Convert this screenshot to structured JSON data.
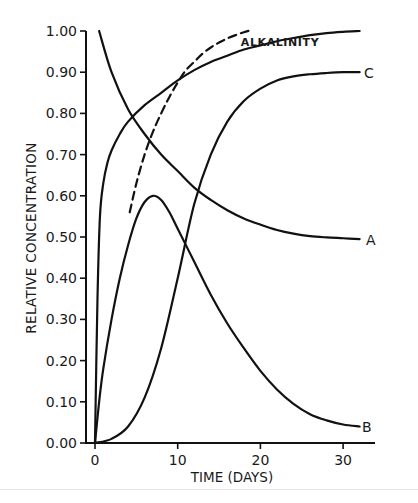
{
  "chart_data": {
    "type": "line",
    "title": "",
    "xlabel": "TIME (DAYS)",
    "ylabel": "RELATIVE CONCENTRATION",
    "xlim": [
      0,
      34
    ],
    "ylim": [
      0,
      1.0
    ],
    "x_ticks": [
      0,
      10,
      20,
      30
    ],
    "x_tick_labels": [
      "0",
      "10",
      "20",
      "30"
    ],
    "y_ticks": [
      0,
      0.1,
      0.2,
      0.3,
      0.4,
      0.5,
      0.6,
      0.7,
      0.8,
      0.9,
      1.0
    ],
    "y_tick_labels": [
      "0.00",
      "0.10",
      "0.20",
      "0.30",
      "0.40",
      "0.50",
      "0.60",
      "0.70",
      "0.80",
      "0.90",
      "1.00"
    ],
    "grid": false,
    "legend": "none (curves labeled directly at right end)",
    "series": [
      {
        "name": "A",
        "style": "solid",
        "x": [
          0.5,
          2,
          4,
          6,
          8,
          10,
          12,
          14,
          16,
          18,
          20,
          22,
          24,
          26,
          28,
          30,
          32
        ],
        "y": [
          1.0,
          0.9,
          0.81,
          0.75,
          0.7,
          0.66,
          0.62,
          0.59,
          0.565,
          0.545,
          0.53,
          0.517,
          0.508,
          0.502,
          0.499,
          0.497,
          0.495
        ]
      },
      {
        "name": "B",
        "style": "solid",
        "x": [
          0,
          0.5,
          1,
          2,
          3,
          4,
          5,
          6,
          7,
          8,
          9,
          10,
          12,
          14,
          16,
          18,
          20,
          22,
          24,
          26,
          28,
          30,
          32
        ],
        "y": [
          0.0,
          0.1,
          0.18,
          0.3,
          0.4,
          0.48,
          0.545,
          0.585,
          0.6,
          0.59,
          0.56,
          0.52,
          0.44,
          0.36,
          0.29,
          0.23,
          0.175,
          0.13,
          0.095,
          0.07,
          0.055,
          0.045,
          0.04
        ]
      },
      {
        "name": "C",
        "style": "solid",
        "x": [
          0,
          2,
          4,
          6,
          8,
          10,
          12,
          14,
          16,
          18,
          20,
          22,
          24,
          26,
          28,
          30,
          32
        ],
        "y": [
          0.0,
          0.01,
          0.04,
          0.11,
          0.23,
          0.4,
          0.58,
          0.7,
          0.78,
          0.83,
          0.86,
          0.88,
          0.89,
          0.895,
          0.898,
          0.9,
          0.9
        ]
      },
      {
        "name": "ALKALINITY",
        "style": "solid",
        "x": [
          0,
          0.3,
          0.6,
          1,
          1.5,
          2,
          3,
          4,
          6,
          8,
          10,
          12,
          14,
          16,
          18,
          20,
          22,
          24,
          26,
          28,
          30,
          32
        ],
        "y": [
          0.0,
          0.35,
          0.55,
          0.63,
          0.68,
          0.71,
          0.75,
          0.78,
          0.82,
          0.85,
          0.88,
          0.905,
          0.925,
          0.94,
          0.955,
          0.965,
          0.975,
          0.983,
          0.99,
          0.995,
          0.998,
          1.0
        ]
      },
      {
        "name": "dashed (unlabeled)",
        "style": "dashed",
        "x": [
          4.2,
          5,
          6,
          7,
          8,
          9,
          10,
          11,
          12,
          13,
          14,
          15,
          16,
          17,
          18,
          19
        ],
        "y": [
          0.56,
          0.63,
          0.7,
          0.755,
          0.8,
          0.84,
          0.875,
          0.905,
          0.925,
          0.945,
          0.96,
          0.972,
          0.982,
          0.99,
          0.997,
          1.003
        ]
      }
    ],
    "annotations": [
      {
        "text": "ALKALINITY",
        "x": 19,
        "y": 0.975
      },
      {
        "text": "C",
        "x": 33.2,
        "y": 0.9
      },
      {
        "text": "A",
        "x": 33.2,
        "y": 0.495
      },
      {
        "text": "B",
        "x": 33.2,
        "y": 0.04
      }
    ]
  },
  "labels": {
    "ylabel": "RELATIVE CONCENTRATION",
    "xlabel": "TIME (DAYS)",
    "alkalinity": "ALKALINITY",
    "curve_a": "A",
    "curve_b": "B",
    "curve_c": "C"
  }
}
